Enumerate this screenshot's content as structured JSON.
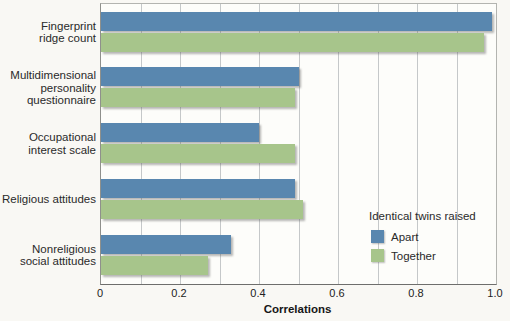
{
  "chart_data": {
    "type": "bar",
    "orientation": "horizontal",
    "title": "",
    "xlabel": "Correlations",
    "ylabel": "",
    "xlim": [
      0,
      1.0
    ],
    "grid": "vertical lines every 0.1",
    "grid_values": [
      0.1,
      0.2,
      0.3,
      0.4,
      0.5,
      0.6,
      0.7,
      0.8,
      0.9
    ],
    "x_ticks": [
      {
        "value": 0,
        "label": "0"
      },
      {
        "value": 0.2,
        "label": "0.2"
      },
      {
        "value": 0.4,
        "label": "0.4"
      },
      {
        "value": 0.6,
        "label": "0.6"
      },
      {
        "value": 0.8,
        "label": "0.8"
      },
      {
        "value": 1.0,
        "label": "1.0"
      }
    ],
    "categories": [
      "Fingerprint ridge count",
      "Multidimensional personality questionnaire",
      "Occupational interest scale",
      "Religious attitudes",
      "Nonreligious social attitudes"
    ],
    "categories_display": [
      [
        "Fingerprint",
        "ridge count"
      ],
      [
        "Multidimensional",
        "personality",
        "questionnaire"
      ],
      [
        "Occupational",
        "interest scale"
      ],
      [
        "Religious attitudes"
      ],
      [
        "Nonreligious",
        "social attitudes"
      ]
    ],
    "series": [
      {
        "name": "Apart",
        "color": "#5987af",
        "values": [
          0.99,
          0.5,
          0.4,
          0.49,
          0.33
        ]
      },
      {
        "name": "Together",
        "color": "#a7c58b",
        "values": [
          0.97,
          0.49,
          0.49,
          0.51,
          0.27
        ]
      }
    ],
    "legend": {
      "title": "Identical twins raised",
      "position": "inside lower right"
    },
    "colors": {
      "apart": "#5987af",
      "together": "#a7c58b",
      "gridline": "#c5c8c9",
      "background": "#f9f8f4"
    }
  }
}
